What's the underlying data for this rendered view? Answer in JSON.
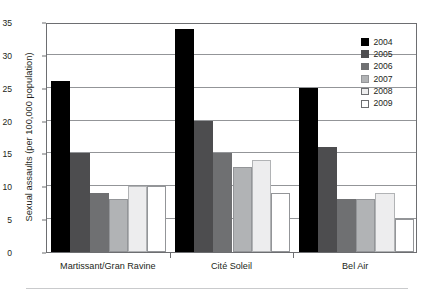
{
  "figure": {
    "top_caption": "",
    "bottom_rule": true
  },
  "chart_data": {
    "type": "bar",
    "title": "",
    "xlabel": "",
    "ylabel": "Sexual assaults (per 100,000 population)",
    "ylim": [
      0,
      35
    ],
    "yticks": [
      0,
      5,
      10,
      15,
      20,
      25,
      30,
      35
    ],
    "ytick_labels": [
      "0",
      "5",
      "10",
      "15",
      "20",
      "25",
      "30",
      "35"
    ],
    "grid": "horizontal",
    "legend_position": "top-right-outside",
    "categories": [
      "Martissant/Gran Ravine",
      "Cité Soleil",
      "Bel Air"
    ],
    "series": [
      {
        "name": "2004",
        "color": "#000000",
        "border": "#000000",
        "values": [
          26,
          34,
          25
        ]
      },
      {
        "name": "2005",
        "color": "#4d4d4f",
        "border": "#4d4d4f",
        "values": [
          15,
          20,
          16
        ]
      },
      {
        "name": "2006",
        "color": "#6f7072",
        "border": "#6f7072",
        "values": [
          9,
          15,
          8
        ]
      },
      {
        "name": "2007",
        "color": "#b1b3b5",
        "border": "#939598",
        "values": [
          8,
          13,
          8
        ]
      },
      {
        "name": "2008",
        "color": "#ededee",
        "border": "#b1b3b5",
        "values": [
          10,
          14,
          9
        ]
      },
      {
        "name": "2009",
        "color": "#ffffff",
        "border": "#939598",
        "values": [
          10,
          9,
          5
        ]
      }
    ]
  },
  "colors": {
    "axis": "#6d6e71",
    "gridline": "#939598",
    "text": "#231f20",
    "background": "#ffffff",
    "bottom_rule": "#c9cacc"
  }
}
